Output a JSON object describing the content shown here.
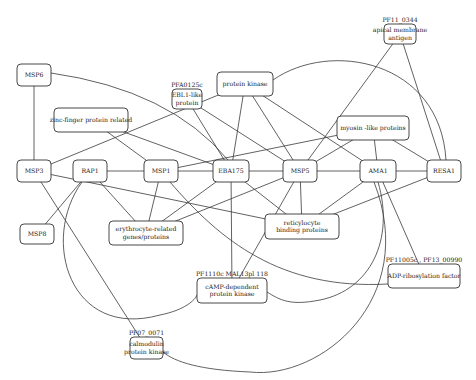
{
  "diagram": {
    "type": "protein interaction network",
    "nodes": [
      {
        "id": "MSP6",
        "label": [
          "MSP6"
        ]
      },
      {
        "id": "MSP3",
        "label": [
          "MSP3"
        ]
      },
      {
        "id": "MSP8",
        "label": [
          "MSP8"
        ]
      },
      {
        "id": "RAP1",
        "label": [
          "RAP1"
        ]
      },
      {
        "id": "MSP1",
        "label": [
          "MSP1"
        ]
      },
      {
        "id": "EBA175",
        "label": [
          "EBA175"
        ]
      },
      {
        "id": "MSP5",
        "label": [
          "MSP5"
        ]
      },
      {
        "id": "AMA1",
        "label": [
          "AMA1"
        ]
      },
      {
        "id": "RESA1",
        "label": [
          "RESA1"
        ]
      },
      {
        "id": "zinc",
        "label": [
          "zinc-finger protein related"
        ]
      },
      {
        "id": "ebl",
        "label": [
          "EBL1-like",
          "protein"
        ],
        "ext": "PFA0125c"
      },
      {
        "id": "pk",
        "label": [
          "protein kinase"
        ]
      },
      {
        "id": "myosin",
        "label": [
          "myosin -like proteins"
        ]
      },
      {
        "id": "apical",
        "label": [
          "apical membrane",
          "antigen"
        ],
        "ext": "PF11_0344"
      },
      {
        "id": "erythro",
        "label": [
          "erythrocyte-related",
          "genes/proteins"
        ]
      },
      {
        "id": "retic",
        "label": [
          "reticylocyte",
          "binding proteins"
        ]
      },
      {
        "id": "camp",
        "label": [
          "cAMP-dependent",
          "protein kinase"
        ],
        "ext": "PF1110c MAL13pl 118"
      },
      {
        "id": "adp",
        "label": [
          "ADP-ribosylation factor"
        ],
        "ext": "PF11005c , PF13_00990"
      },
      {
        "id": "calmod",
        "label": [
          "calmodulin",
          "protein kinase"
        ],
        "ext": "PF07_0071"
      }
    ],
    "edges": [
      [
        "MSP6",
        "MSP3"
      ],
      [
        "MSP6",
        "EBA175"
      ],
      [
        "MSP3",
        "pk"
      ],
      [
        "MSP3",
        "retic"
      ],
      [
        "MSP3",
        "calmod"
      ],
      [
        "MSP8",
        "RAP1"
      ],
      [
        "RAP1",
        "MSP1"
      ],
      [
        "RAP1",
        "erythro"
      ],
      [
        "RAP1",
        "camp"
      ],
      [
        "zinc",
        "MSP1"
      ],
      [
        "zinc",
        "EBA175"
      ],
      [
        "ebl",
        "EBA175"
      ],
      [
        "ebl",
        "MSP5"
      ],
      [
        "pk",
        "EBA175"
      ],
      [
        "pk",
        "MSP5"
      ],
      [
        "pk",
        "AMA1"
      ],
      [
        "pk",
        "RESA1"
      ],
      [
        "MSP1",
        "EBA175"
      ],
      [
        "MSP1",
        "myosin"
      ],
      [
        "MSP1",
        "erythro"
      ],
      [
        "MSP1",
        "adp"
      ],
      [
        "EBA175",
        "MSP5"
      ],
      [
        "EBA175",
        "erythro"
      ],
      [
        "EBA175",
        "retic"
      ],
      [
        "EBA175",
        "camp"
      ],
      [
        "MSP5",
        "AMA1"
      ],
      [
        "MSP5",
        "apical"
      ],
      [
        "MSP5",
        "myosin"
      ],
      [
        "MSP5",
        "retic"
      ],
      [
        "MSP5",
        "camp"
      ],
      [
        "MSP5",
        "erythro"
      ],
      [
        "AMA1",
        "RESA1"
      ],
      [
        "AMA1",
        "myosin"
      ],
      [
        "AMA1",
        "retic"
      ],
      [
        "AMA1",
        "adp"
      ],
      [
        "AMA1",
        "camp"
      ],
      [
        "AMA1",
        "calmod"
      ],
      [
        "RESA1",
        "myosin"
      ],
      [
        "RESA1",
        "apical"
      ],
      [
        "RESA1",
        "retic"
      ]
    ]
  }
}
